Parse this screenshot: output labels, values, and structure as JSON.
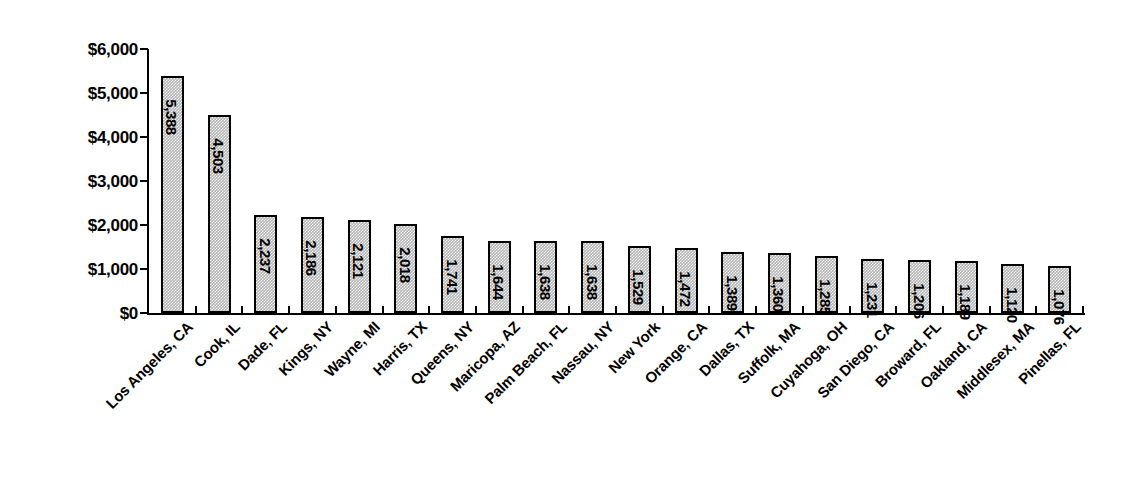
{
  "chart_data": {
    "type": "bar",
    "title": "",
    "subtitle": "",
    "xlabel": "",
    "ylabel": "",
    "ylim": [
      0,
      6000
    ],
    "ytick_labels": [
      "$6,000",
      "$5,000",
      "$4,000",
      "$3,000",
      "$2,000",
      "$1,000",
      "$0"
    ],
    "ytick_values": [
      6000,
      5000,
      4000,
      3000,
      2000,
      1000,
      0
    ],
    "grid": false,
    "legend": false,
    "orientation": "vertical",
    "value_label_rotation": 90,
    "category_label_rotation": 45,
    "bar_fill_color": "#b3b3b3",
    "bar_edge_color": "#000000",
    "axis_color": "#000000",
    "background_color": "#ffffff",
    "categories": [
      "Los Angeles, CA",
      "Cook, IL",
      "Dade, FL",
      "Kings, NY",
      "Wayne, MI",
      "Harris, TX",
      "Queens, NY",
      "Maricopa, AZ",
      "Palm Beach, FL",
      "Nassau, NY",
      "New York",
      "Orange, CA",
      "Dallas, TX",
      "Suffolk, MA",
      "Cuyahoga, OH",
      "San Diego, CA",
      "Broward, FL",
      "Oakland, CA",
      "Middlesex, MA",
      "Pinellas, FL"
    ],
    "values": [
      5388,
      4503,
      2237,
      2186,
      2121,
      2018,
      1741,
      1644,
      1638,
      1638,
      1529,
      1472,
      1389,
      1360,
      1285,
      1231,
      1206,
      1189,
      1120,
      1076
    ],
    "value_labels": [
      "5,388",
      "4,503",
      "2,237",
      "2,186",
      "2,121",
      "2,018",
      "1,741",
      "1,644",
      "1,638",
      "1,638",
      "1,529",
      "1,472",
      "1,389",
      "1,360",
      "1,285",
      "1,231",
      "1,206",
      "1,189",
      "1,120",
      "1,076"
    ]
  }
}
